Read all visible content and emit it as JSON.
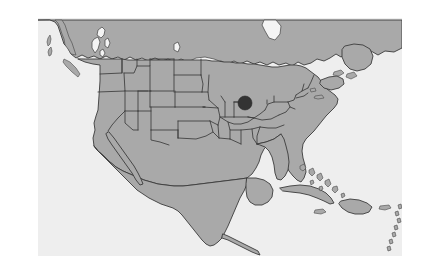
{
  "figure": {
    "kind": "reference-map",
    "width_px": 421,
    "height_px": 280,
    "canvas": {
      "left_px": 38,
      "top_px": 18,
      "width_px": 364,
      "height_px": 238,
      "background_color": "#eeeeee"
    }
  },
  "legend_colors": {
    "land_fill": "#a9a9a9",
    "land_outline": "#3b3b3b",
    "water_fill": "#f4f4f4",
    "state_border": "#3b3b3b",
    "marker_fill": "#333333",
    "page_background": "#ffffff"
  },
  "marker": {
    "name": "location-marker",
    "shape": "filled-circle",
    "color": "#333333",
    "radius_px": 7,
    "center_x_px": 245,
    "center_y_px": 103,
    "region_label": "Northern Illinois / Chicago area"
  },
  "regions": {
    "countries": [
      "Canada",
      "United States",
      "Mexico",
      "Cuba",
      "Bahamas",
      "Haiti",
      "Dominican Republic",
      "Jamaica",
      "Puerto Rico",
      "Belize",
      "Guatemala",
      "Honduras"
    ],
    "water_bodies": [
      "Lake Superior",
      "Lake Michigan",
      "Lake Huron",
      "Lake Erie",
      "Lake Ontario",
      "Great Slave Lake",
      "Lake Winnipeg",
      "Gulf of Mexico",
      "Atlantic Ocean",
      "Pacific Ocean",
      "Hudson Bay",
      "Gulf of St. Lawrence"
    ],
    "notable_landforms": [
      "Baja California Peninsula",
      "Florida Peninsula",
      "Vancouver Island",
      "Newfoundland",
      "Nova Scotia",
      "Yucatan Peninsula",
      "Cape Cod",
      "Long Island"
    ]
  },
  "map_style": {
    "projection_hint": "conic",
    "shows_state_boundaries": true,
    "shows_country_boundaries": true,
    "shows_labels": false,
    "shows_graticule": false
  }
}
